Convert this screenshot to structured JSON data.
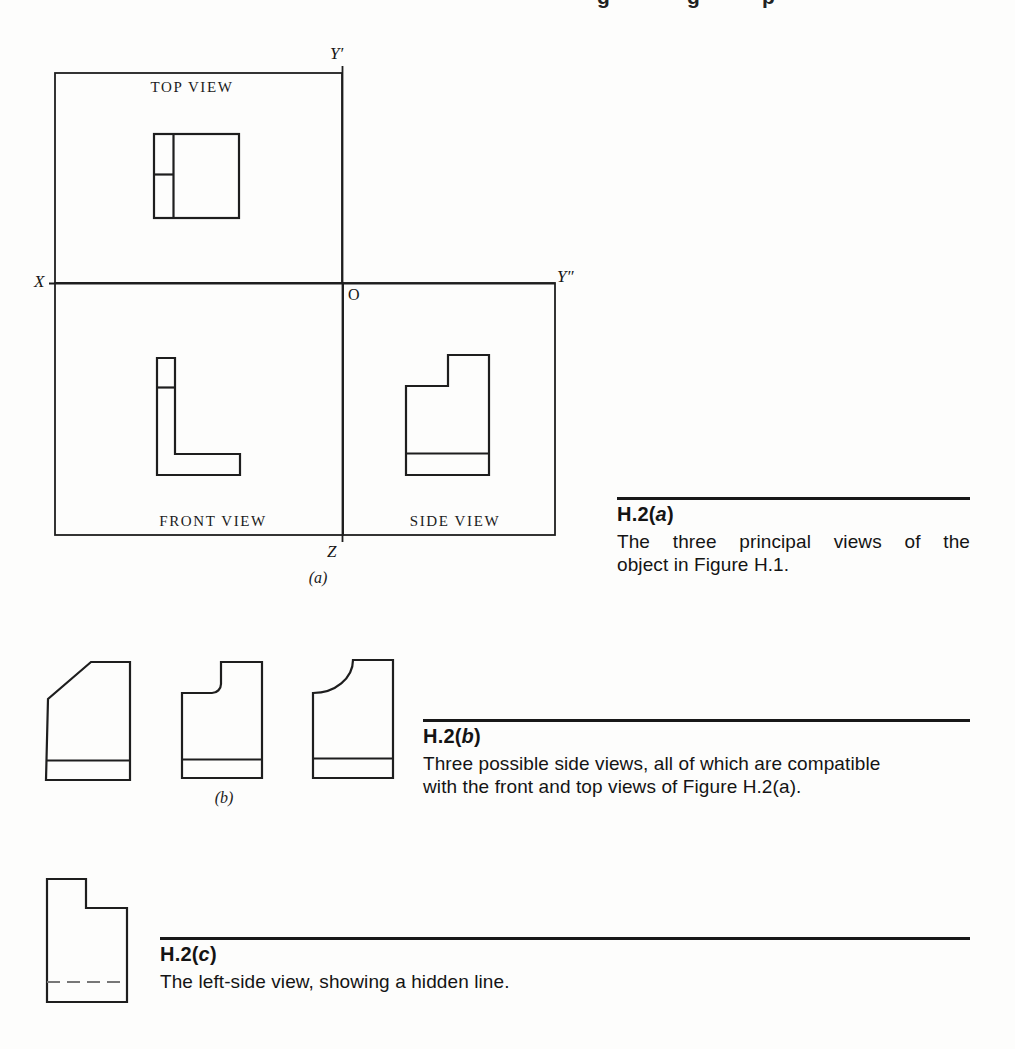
{
  "page": {
    "top_fragments": [
      "g",
      "g",
      "p"
    ]
  },
  "figure_a": {
    "axis": {
      "y_prime": "Y′",
      "x": "X",
      "origin": "O",
      "y_dprime": "Y″",
      "z": "Z"
    },
    "view_labels": {
      "top": "TOP VIEW",
      "front": "FRONT VIEW",
      "side": "SIDE VIEW"
    },
    "panel_label": "(a)",
    "caption": {
      "id_prefix": "H.2(",
      "id_letter": "a",
      "id_suffix": ")",
      "line1": "The three principal views of the",
      "line2": "object in Figure H.1."
    }
  },
  "figure_b": {
    "panel_label": "(b)",
    "caption": {
      "id_prefix": "H.2(",
      "id_letter": "b",
      "id_suffix": ")",
      "line1": "Three possible side views, all of which are compatible",
      "line2": "with the front and top views of Figure H.2(a)."
    }
  },
  "figure_c": {
    "caption": {
      "id_prefix": "H.2(",
      "id_letter": "c",
      "id_suffix": ")",
      "line1": "The left-side view, showing a hidden line."
    }
  },
  "colors": {
    "line": "#1e1e1e",
    "hidden_line": "#777777",
    "rule": "#181818",
    "paper": "#fdfdfc"
  }
}
